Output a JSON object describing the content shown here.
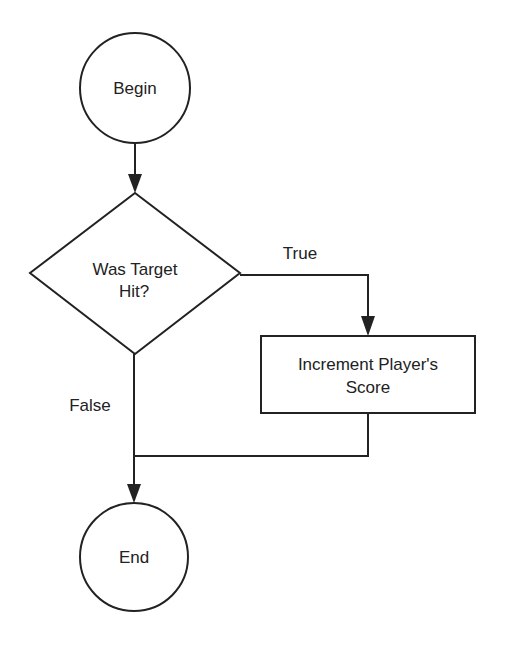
{
  "diagram": {
    "type": "flowchart",
    "nodes": {
      "begin": {
        "label": "Begin",
        "shape": "circle"
      },
      "decision": {
        "label_line1": "Was Target",
        "label_line2": "Hit?",
        "shape": "diamond"
      },
      "process": {
        "label_line1": "Increment Player's",
        "label_line2": "Score",
        "shape": "rectangle"
      },
      "end": {
        "label": "End",
        "shape": "circle"
      }
    },
    "edges": {
      "true_label": "True",
      "false_label": "False"
    },
    "colors": {
      "stroke": "#222222",
      "background": "#ffffff"
    }
  }
}
